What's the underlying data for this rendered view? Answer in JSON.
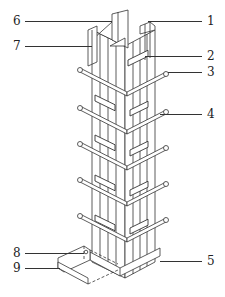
{
  "diagram": {
    "labels": [
      {
        "id": "1",
        "text": "1",
        "x": 207,
        "y": 16,
        "lx1": 148,
        "lx2": 202,
        "ly": 21
      },
      {
        "id": "2",
        "text": "2",
        "x": 207,
        "y": 50,
        "lx1": 145,
        "lx2": 202,
        "ly": 56
      },
      {
        "id": "3",
        "text": "3",
        "x": 207,
        "y": 67,
        "lx1": 168,
        "lx2": 202,
        "ly": 72
      },
      {
        "id": "4",
        "text": "4",
        "x": 207,
        "y": 109,
        "lx1": 160,
        "lx2": 202,
        "ly": 114
      },
      {
        "id": "5",
        "text": "5",
        "x": 207,
        "y": 256,
        "lx1": 160,
        "lx2": 202,
        "ly": 261
      },
      {
        "id": "6",
        "text": "6",
        "x": 14,
        "y": 16,
        "lx1": 25,
        "lx2": 112,
        "ly": 21
      },
      {
        "id": "7",
        "text": "7",
        "x": 14,
        "y": 41,
        "lx1": 25,
        "lx2": 92,
        "ly": 46
      },
      {
        "id": "8",
        "text": "8",
        "x": 14,
        "y": 248,
        "lx1": 25,
        "lx2": 84,
        "ly": 253
      },
      {
        "id": "9",
        "text": "9",
        "x": 14,
        "y": 264,
        "lx1": 25,
        "lx2": 60,
        "ly": 268
      }
    ],
    "colors": {
      "line": "#333333",
      "background": "#ffffff"
    }
  }
}
